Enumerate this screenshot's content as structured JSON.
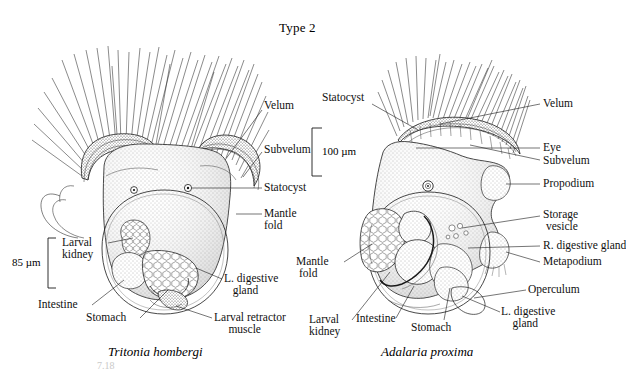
{
  "figure": {
    "title": "Type 2",
    "caption_partial": "7.18"
  },
  "left_specimen": {
    "name": "Tritonia hombergi",
    "scale_bar": "85 µm",
    "labels": [
      {
        "id": "velum",
        "text": "Velum"
      },
      {
        "id": "subvelum",
        "text": "Subvelum"
      },
      {
        "id": "statocyst",
        "text": "Statocyst"
      },
      {
        "id": "mantle-fold",
        "text": "Mantle\nfold"
      },
      {
        "id": "larval-kidney",
        "text": "Larval\nkidney"
      },
      {
        "id": "intestine",
        "text": "Intestine"
      },
      {
        "id": "stomach",
        "text": "Stomach"
      },
      {
        "id": "l-digestive-gland",
        "text": "L. digestive\n   gland"
      },
      {
        "id": "larval-retractor-muscle",
        "text": "Larval retractor\n     muscle"
      }
    ]
  },
  "right_specimen": {
    "name": "Adalaria proxima",
    "scale_bar": "100 µm",
    "labels": [
      {
        "id": "statocyst",
        "text": "Statocyst"
      },
      {
        "id": "velum",
        "text": "Velum"
      },
      {
        "id": "eye",
        "text": "Eye"
      },
      {
        "id": "subvelum",
        "text": "Subvelum"
      },
      {
        "id": "propodium",
        "text": "Propodium"
      },
      {
        "id": "storage-vesicle",
        "text": "Storage\n vesicle"
      },
      {
        "id": "r-digestive-gland",
        "text": "R. digestive gland"
      },
      {
        "id": "metapodium",
        "text": "Metapodium"
      },
      {
        "id": "operculum",
        "text": "Operculum"
      },
      {
        "id": "l-digestive-gland",
        "text": "L. digestive\n    gland"
      },
      {
        "id": "mantle-fold",
        "text": "Mantle\n fold"
      },
      {
        "id": "larval-kidney",
        "text": "Larval\nkidney"
      },
      {
        "id": "intestine",
        "text": "Intestine"
      },
      {
        "id": "stomach",
        "text": "Stomach"
      }
    ]
  },
  "colors": {
    "ink": "#1a1a1a",
    "stipple": "#555555",
    "background": "#ffffff",
    "eye": "#000000"
  }
}
